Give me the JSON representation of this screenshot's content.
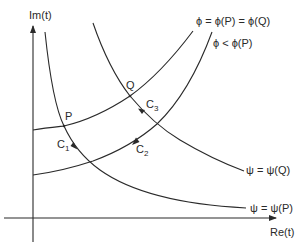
{
  "axes": {
    "y_label": "Im(t)",
    "x_label": "Re(t)"
  },
  "points": {
    "P": "P",
    "Q": "Q"
  },
  "curves": {
    "phi_level": "ϕ = ϕ(P) = ϕ(Q)",
    "phi_lower": "ϕ < ϕ(P)",
    "psi_Q": "ψ = ψ(Q)",
    "psi_P": "ψ = ψ(P)"
  },
  "contours": {
    "C1": {
      "base": "C",
      "sub": "1"
    },
    "C2": {
      "base": "C",
      "sub": "2"
    },
    "C3": {
      "base": "C",
      "sub": "3"
    }
  },
  "colors": {
    "stroke": "#2a2a2a",
    "background": "#ffffff"
  }
}
